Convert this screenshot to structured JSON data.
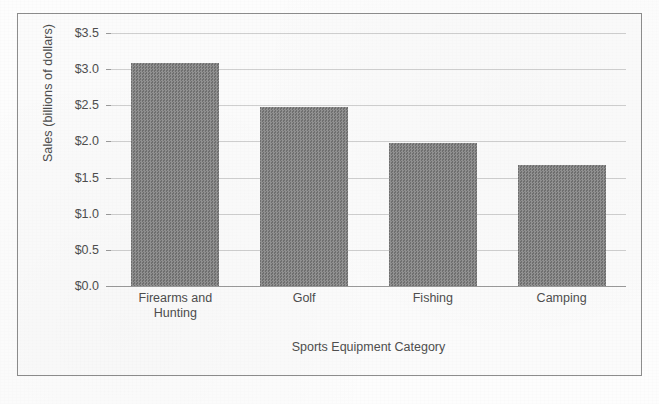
{
  "chart_data": {
    "type": "bar",
    "title": "",
    "xlabel": "Sports Equipment Category",
    "ylabel": "Sales (billions of dollars)",
    "categories": [
      "Firearms and Hunting",
      "Golf",
      "Fishing",
      "Camping"
    ],
    "values": [
      3.09,
      2.48,
      1.98,
      1.68
    ],
    "ylim": [
      0.0,
      3.5
    ],
    "y_tick_step": 0.5,
    "y_tick_labels": [
      "$3.5",
      "$3.0",
      "$2.5",
      "$2.0",
      "$1.5",
      "$1.0",
      "$0.5",
      "$0.0"
    ],
    "y_tick_values": [
      3.5,
      3.0,
      2.5,
      2.0,
      1.5,
      1.0,
      0.5,
      0.0
    ],
    "grid": true,
    "legend": "none",
    "bar_color": "#7d7d7d",
    "gridline_color": "#cfcfcf",
    "axis_color": "#9a9a9a",
    "text_color": "#4e4e4e",
    "background_color": "#fbfbfb",
    "border_color": "#8d8d8d"
  },
  "categories_display": [
    {
      "line1": "Firearms and",
      "line2": "Hunting"
    },
    {
      "line1": "Golf",
      "line2": ""
    },
    {
      "line1": "Fishing",
      "line2": ""
    },
    {
      "line1": "Camping",
      "line2": ""
    }
  ]
}
